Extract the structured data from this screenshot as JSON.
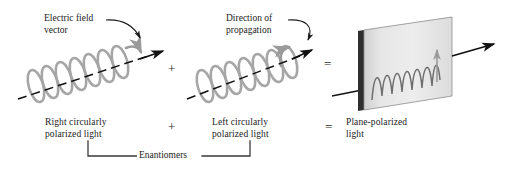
{
  "figure": {
    "background": "#ffffff"
  },
  "annotations": {
    "electric_field": "Electric field\nvector",
    "direction_of_propagation": "Direction of\npropagation"
  },
  "operators": {
    "top_plus": "+",
    "top_equals": "=",
    "bottom_plus": "+",
    "bottom_equals": "="
  },
  "captions": {
    "right_circular": "Right circularly\npolarized light",
    "left_circular": "Left circularly\npolarized light",
    "plane_polarized": "Plane-polarized\nlight",
    "enantiomers": "Enantiomers"
  },
  "colors": {
    "helix": "#a6a6a6",
    "helix_dark": "#8f8f8f",
    "axis": "#111111",
    "arrow": "#111111",
    "plane_fill_light": "#e9e9e9",
    "plane_fill_dark": "#c9c9c9",
    "plane_edge": "#2b2b2b",
    "wave": "#6f6f6f",
    "text": "#1c1c1c",
    "bracket": "#3a3a3a"
  },
  "diagram": {
    "type": "physics-schematic",
    "panels": [
      {
        "id": "right-circular",
        "kind": "helix",
        "handedness": "right",
        "coil_count": 7,
        "caption": "Right circularly polarized light"
      },
      {
        "id": "left-circular",
        "kind": "helix",
        "handedness": "left",
        "coil_count": 7,
        "caption": "Left circularly polarized light"
      },
      {
        "id": "plane-polarized",
        "kind": "plane-with-sine-wave",
        "wave_cycles": 6,
        "caption": "Plane-polarized light"
      }
    ]
  }
}
